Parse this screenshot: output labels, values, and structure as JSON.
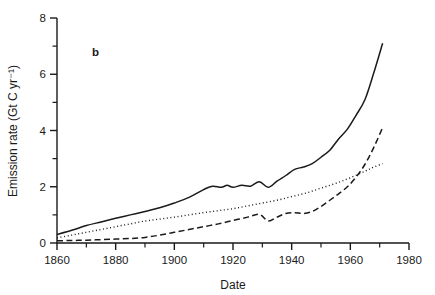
{
  "figure": {
    "panel_label": "b",
    "background_color": "#ffffff",
    "ink_color": "#1a1a1a"
  },
  "chart_data": {
    "type": "line",
    "title": "",
    "xlabel": "Date",
    "ylabel": "Emission rate (Gt C yr⁻¹)",
    "xlim": [
      1860,
      1980
    ],
    "ylim": [
      0,
      8
    ],
    "grid": false,
    "legend": "none",
    "x_major_ticks": [
      1860,
      1880,
      1900,
      1920,
      1940,
      1960,
      1980
    ],
    "x_minor_ticks": [
      1870,
      1890,
      1910,
      1930,
      1950,
      1970
    ],
    "x_tick_labels": [
      "1860",
      "1880",
      "1900",
      "1920",
      "1940",
      "1960",
      "1980"
    ],
    "y_major_ticks": [
      0,
      2,
      4,
      6,
      8
    ],
    "y_minor_ticks": [
      1,
      3,
      5,
      7
    ],
    "y_tick_labels": [
      "0",
      "2",
      "4",
      "6",
      "8"
    ],
    "series": [
      {
        "name": "total",
        "style": "solid",
        "x": [
          1860,
          1865,
          1870,
          1875,
          1880,
          1885,
          1890,
          1895,
          1900,
          1905,
          1910,
          1913,
          1916,
          1918,
          1920,
          1923,
          1926,
          1929,
          1932,
          1935,
          1938,
          1941,
          1944,
          1947,
          1950,
          1953,
          1956,
          1959,
          1962,
          1965,
          1968,
          1971
        ],
        "values": [
          0.3,
          0.45,
          0.62,
          0.75,
          0.88,
          1.0,
          1.12,
          1.25,
          1.42,
          1.62,
          1.9,
          2.02,
          1.98,
          2.05,
          1.98,
          2.05,
          2.02,
          2.18,
          1.98,
          2.2,
          2.4,
          2.62,
          2.7,
          2.82,
          3.05,
          3.3,
          3.7,
          4.05,
          4.55,
          5.1,
          6.05,
          7.1
        ]
      },
      {
        "name": "land-use",
        "style": "dotted",
        "x": [
          1860,
          1865,
          1870,
          1875,
          1880,
          1885,
          1890,
          1895,
          1900,
          1905,
          1910,
          1915,
          1920,
          1925,
          1930,
          1935,
          1940,
          1945,
          1950,
          1955,
          1960,
          1965,
          1968,
          1971
        ],
        "values": [
          0.18,
          0.28,
          0.38,
          0.48,
          0.58,
          0.68,
          0.78,
          0.85,
          0.92,
          1.0,
          1.08,
          1.15,
          1.22,
          1.32,
          1.42,
          1.52,
          1.65,
          1.78,
          1.95,
          2.12,
          2.32,
          2.55,
          2.7,
          2.82
        ]
      },
      {
        "name": "fossil-fuel",
        "style": "dashed",
        "x": [
          1860,
          1865,
          1870,
          1875,
          1880,
          1885,
          1890,
          1895,
          1900,
          1905,
          1910,
          1915,
          1920,
          1925,
          1929,
          1932,
          1935,
          1938,
          1941,
          1944,
          1947,
          1950,
          1953,
          1956,
          1959,
          1962,
          1965,
          1968,
          1971
        ],
        "values": [
          0.08,
          0.09,
          0.1,
          0.12,
          0.14,
          0.16,
          0.2,
          0.28,
          0.38,
          0.48,
          0.58,
          0.68,
          0.8,
          0.92,
          1.02,
          0.78,
          0.92,
          1.05,
          1.08,
          1.05,
          1.12,
          1.3,
          1.52,
          1.75,
          2.0,
          2.35,
          2.8,
          3.4,
          4.1
        ]
      }
    ]
  }
}
